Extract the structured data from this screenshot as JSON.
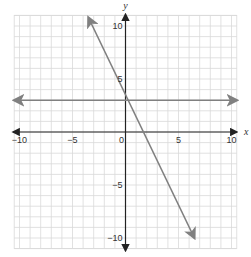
{
  "chart_data": {
    "type": "line",
    "title": "",
    "xlabel": "x",
    "ylabel": "y",
    "xlim": [
      -10,
      10
    ],
    "ylim": [
      -10,
      10
    ],
    "grid": true,
    "grid_step": 1,
    "x_ticks": [
      {
        "value": -10,
        "label": "−10"
      },
      {
        "value": -5,
        "label": "−5"
      },
      {
        "value": 0,
        "label": "0"
      },
      {
        "value": 5,
        "label": "5"
      },
      {
        "value": 10,
        "label": "10"
      }
    ],
    "y_ticks": [
      {
        "value": 10,
        "label": "10"
      },
      {
        "value": 5,
        "label": "5"
      },
      {
        "value": -5,
        "label": "−5"
      },
      {
        "value": -10,
        "label": "−10"
      }
    ],
    "series": [
      {
        "name": "y = 3",
        "equation": "y = 3",
        "slope": 0,
        "intercept": 3,
        "from": [
          -10.5,
          3
        ],
        "to": [
          10.5,
          3
        ],
        "color": "#808080"
      },
      {
        "name": "y = -2x + 3",
        "equation": "y = -2x + 3",
        "slope": -2,
        "intercept": 3,
        "from": [
          -3.5,
          10.8
        ],
        "to": [
          6.5,
          -10.0
        ],
        "color": "#808080"
      }
    ],
    "colors": {
      "grid": "#d9d9d9",
      "axes": "#222222",
      "lines": "#808080"
    }
  }
}
